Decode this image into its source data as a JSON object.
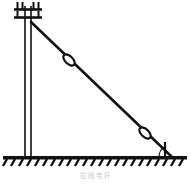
{
  "figure": {
    "caption": "拉线电杆",
    "caption_color": "#c9c9c9",
    "background_color": "#ffffff",
    "ink_color": "#111111",
    "title_alt": "Utility pole with guy wire",
    "parts": {
      "pole_label": "utility-pole",
      "crossarm_upper_label": "upper-crossarm",
      "crossarm_lower_label": "lower-crossarm",
      "guy_wire_label": "guy-wire",
      "insulator_upper_label": "strain-insulator-upper",
      "insulator_lower_label": "strain-insulator-lower",
      "ground_label": "ground-line",
      "anchor_label": "ground-anchor",
      "angle_label": "anchor-angle-arc"
    }
  },
  "geometry": {
    "pole": {
      "x_left": 24,
      "x_right": 31,
      "y_top": 8,
      "y_bottom": 158
    },
    "crossarms": [
      {
        "y": 8,
        "x_start": 15,
        "x_end": 41
      },
      {
        "y": 16,
        "x_start": 15,
        "x_end": 41
      }
    ],
    "insulator_pins": [
      {
        "x": 17,
        "y_top": 2,
        "y_bottom": 9
      },
      {
        "x": 22,
        "y_top": 2,
        "y_bottom": 9
      },
      {
        "x": 33,
        "y_top": 2,
        "y_bottom": 9
      },
      {
        "x": 38,
        "y_top": 2,
        "y_bottom": 9
      },
      {
        "x": 17,
        "y_top": 11,
        "y_bottom": 17
      },
      {
        "x": 38,
        "y_top": 11,
        "y_bottom": 17
      }
    ],
    "guy_wire": {
      "x1": 31,
      "y1": 22,
      "x2": 172,
      "y2": 157
    },
    "strain_insulators": [
      {
        "cx": 69,
        "cy": 60,
        "rx": 6.5,
        "ry": 3.6
      },
      {
        "cx": 145,
        "cy": 133,
        "rx": 6.5,
        "ry": 3.6
      }
    ],
    "ground": {
      "y": 158,
      "x_start": 4,
      "x_end": 186,
      "thickness": 3
    },
    "hatching": {
      "count": 22,
      "length": 8,
      "slant_dx": -4,
      "spacing": 8
    },
    "anchor_post": {
      "x": 165,
      "y_top": 143,
      "y_bottom": 158
    },
    "angle_arc": {
      "cx": 172,
      "cy": 157,
      "r": 14
    }
  }
}
